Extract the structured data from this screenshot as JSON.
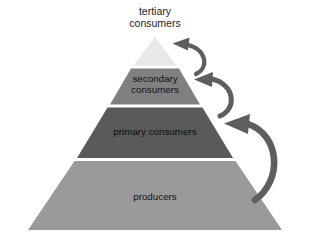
{
  "diagram": {
    "background_color": "#ffffff",
    "width": 309,
    "height": 244,
    "levels": [
      {
        "id": "tertiary",
        "label": "tertiary\nconsumers",
        "label_position": "above-apex",
        "fill_color": "#e8e8e8",
        "text_color": "#1d1d1d",
        "rank": 4
      },
      {
        "id": "secondary",
        "label": "secondary\nconsumers",
        "label_position": "inside",
        "fill_color": "#808080",
        "text_color": "#111111",
        "rank": 3
      },
      {
        "id": "primary",
        "label": "primary consumers",
        "label_position": "inside",
        "fill_color": "#5a5a5a",
        "text_color": "#0d0d0d",
        "rank": 2
      },
      {
        "id": "producers",
        "label": "producers",
        "label_position": "inside",
        "fill_color": "#9a9a9a",
        "text_color": "#141414",
        "rank": 1
      }
    ],
    "arrows": {
      "color": "#5e5e5e",
      "count": 3,
      "items": [
        {
          "id": "arrow-producers-to-primary",
          "from": "producers",
          "to": "primary"
        },
        {
          "id": "arrow-primary-to-secondary",
          "from": "primary",
          "to": "secondary"
        },
        {
          "id": "arrow-secondary-to-tertiary",
          "from": "secondary",
          "to": "tertiary"
        }
      ]
    }
  }
}
